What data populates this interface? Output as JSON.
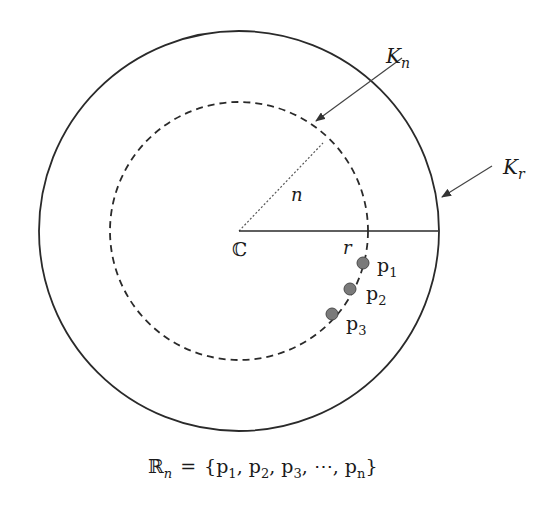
{
  "diagram": {
    "center": {
      "label": "ℂ",
      "x": 239,
      "y": 231
    },
    "outer_circle": {
      "label_main": "K",
      "label_sub": "r",
      "radius": 200,
      "style": "solid"
    },
    "inner_circle": {
      "label_main": "K",
      "label_sub": "n",
      "radius": 129,
      "style": "dashed"
    },
    "radius_n": {
      "label": "n",
      "style": "dotted"
    },
    "radius_r": {
      "label": "r",
      "style": "solid"
    },
    "points": [
      {
        "main": "p",
        "sub": "1",
        "x": 363,
        "y": 263
      },
      {
        "main": "p",
        "sub": "2",
        "x": 350,
        "y": 289
      },
      {
        "main": "p",
        "sub": "3",
        "x": 332,
        "y": 314
      }
    ],
    "formula": {
      "lhs_main": "ℝ",
      "lhs_sub": "n",
      "equals": "=",
      "set_text_1": "{p",
      "s1": "1",
      "c1": ", p",
      "s2": "2",
      "c2": ", p",
      "s3": "3",
      "c3": ", ⋯, p",
      "sn": "n",
      "close": "}"
    },
    "colors": {
      "line": "#2a2a2a",
      "point_fill": "#7a7a7a",
      "point_stroke": "#4a4a4a",
      "arrow": "#444444"
    }
  }
}
